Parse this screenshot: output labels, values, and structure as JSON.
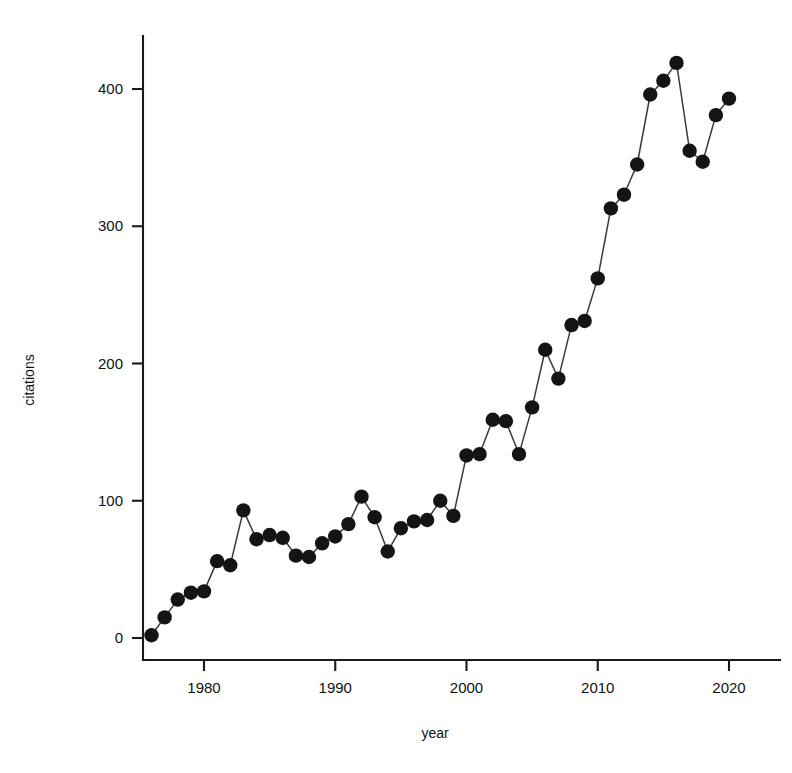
{
  "chart_data": {
    "type": "line",
    "title": "",
    "subtitle": "",
    "xlabel": "year",
    "ylabel": "citations",
    "xlim": [
      1974.6,
      2021.6
    ],
    "ylim": [
      -22,
      448
    ],
    "grid": false,
    "legend": null,
    "markers": "filled-circle",
    "marker_color": "#141414",
    "line_color": "#3a3a3a",
    "x_ticks": [
      1980,
      1990,
      2000,
      2010,
      2020
    ],
    "x_tick_labels": [
      "1980",
      "1990",
      "2000",
      "2010",
      "2020"
    ],
    "y_ticks": [
      0,
      100,
      200,
      300,
      400
    ],
    "y_tick_labels": [
      "0",
      "100",
      "200",
      "300",
      "400"
    ],
    "x": [
      1976,
      1977,
      1978,
      1979,
      1980,
      1981,
      1982,
      1983,
      1984,
      1985,
      1986,
      1987,
      1988,
      1989,
      1990,
      1991,
      1992,
      1993,
      1994,
      1995,
      1996,
      1997,
      1998,
      1999,
      2000,
      2001,
      2002,
      2003,
      2004,
      2005,
      2006,
      2007,
      2008,
      2009,
      2010,
      2011,
      2012,
      2013,
      2014,
      2015,
      2016,
      2017,
      2018,
      2019,
      2020
    ],
    "values": [
      2,
      15,
      28,
      33,
      34,
      56,
      53,
      93,
      72,
      75,
      73,
      60,
      59,
      69,
      74,
      83,
      103,
      88,
      63,
      80,
      85,
      86,
      100,
      89,
      133,
      134,
      159,
      158,
      134,
      168,
      210,
      189,
      228,
      231,
      262,
      313,
      323,
      345,
      396,
      406,
      419,
      355,
      347,
      381,
      393
    ]
  },
  "axes": {
    "x_axis_label": "year",
    "y_axis_label": "citations"
  }
}
